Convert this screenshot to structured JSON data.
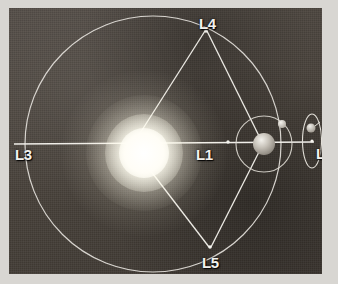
{
  "figure": {
    "frame_color": "#d8d6d2",
    "plate_color": "#4a443f",
    "line_color": "#e9e7e2",
    "label_color": "#f2f1ee"
  },
  "labels": {
    "l1": "L1",
    "l2": "L2",
    "l3": "L3",
    "l4": "L4",
    "l5": "L5"
  },
  "bodies": {
    "sun": "Sun",
    "earth": "Earth",
    "moon": "Moon",
    "spacecraft": "Spacecraft"
  },
  "geometry": {
    "orbit_circle": {
      "cx": 144,
      "cy": 136,
      "r": 128
    },
    "sun": {
      "cx": 135,
      "cy": 145,
      "r": 25
    },
    "earth": {
      "cx": 264,
      "cy": 144,
      "r": 11
    },
    "moon_orbit": {
      "cx": 264,
      "cy": 144,
      "r": 28
    },
    "moon": {
      "cx": 282,
      "cy": 124,
      "r": 4
    },
    "halo_orbit": {
      "cx": 312,
      "cy": 141,
      "rx": 10,
      "ry": 27
    },
    "points": {
      "l1": {
        "x": 228,
        "y": 142
      },
      "l2": {
        "x": 312,
        "y": 141
      },
      "l3": {
        "x": 14,
        "y": 144
      },
      "l4": {
        "x": 205,
        "y": 31
      },
      "l5": {
        "x": 209,
        "y": 247
      }
    },
    "label_positions": {
      "l1": {
        "x": 196,
        "y": 147
      },
      "l2": {
        "x": 316,
        "y": 146
      },
      "l3": {
        "x": 15,
        "y": 147
      },
      "l4": {
        "x": 199,
        "y": 16
      },
      "l5": {
        "x": 202,
        "y": 255
      }
    }
  }
}
